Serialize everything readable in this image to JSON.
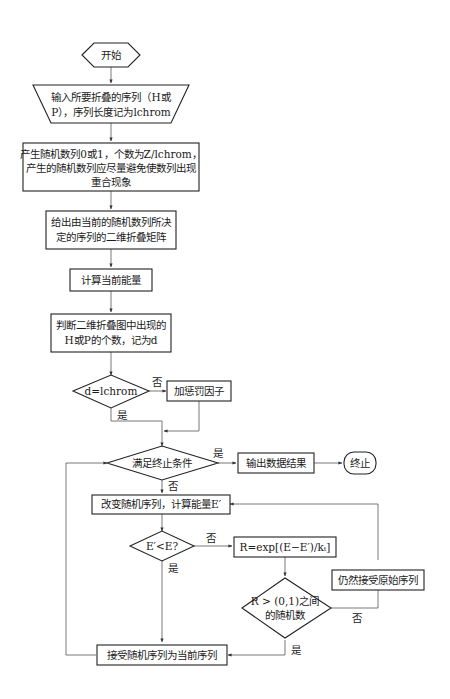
{
  "diagram": {
    "type": "flowchart",
    "nodes": {
      "start": {
        "shape": "hexagon",
        "label": "开始"
      },
      "input": {
        "shape": "trapezoid",
        "lines": [
          "输入所要折叠的序列（H或",
          "P），序列长度记为lchrom"
        ]
      },
      "gen_random": {
        "shape": "rect",
        "lines": [
          "产生随机数列0或1，个数为Z/lchrom，",
          "产生的随机数列应尽量避免使数列出现",
          "重合现象"
        ]
      },
      "matrix": {
        "shape": "rect",
        "lines": [
          "给出由当前的随机数列所决",
          "定的序列的二维折叠矩阵"
        ]
      },
      "calc_energy": {
        "shape": "rect",
        "label": "计算当前能量"
      },
      "count_hp": {
        "shape": "rect",
        "lines": [
          "判断二维折叠图中出现的",
          "H或P的个数，记为d"
        ]
      },
      "check_d": {
        "shape": "diamond",
        "label": "d=lchrom"
      },
      "penalty": {
        "shape": "rect",
        "label": "加惩罚因子"
      },
      "terminate_check": {
        "shape": "diamond",
        "label": "满足终止条件"
      },
      "output": {
        "shape": "rect",
        "label": "输出数据结果"
      },
      "end": {
        "shape": "rounded",
        "label": "终止"
      },
      "change_seq": {
        "shape": "rect",
        "label": "改变随机序列，计算能量E′"
      },
      "compare_e": {
        "shape": "diamond",
        "label": "E′<E?"
      },
      "compute_r": {
        "shape": "rect",
        "label": "R=exp[(E−E′)/kₜ]"
      },
      "r_check": {
        "shape": "diamond",
        "lines": [
          "R > (0,1)之间",
          "的随机数"
        ]
      },
      "keep_original": {
        "shape": "rect",
        "label": "仍然接受原始序列"
      },
      "accept_seq": {
        "shape": "rect",
        "label": "接受随机序列为当前序列"
      }
    },
    "edge_labels": {
      "check_d_no": "否",
      "check_d_yes": "是",
      "terminate_yes": "是",
      "terminate_no": "否",
      "compare_no": "否",
      "compare_yes": "是",
      "r_check_no": "否",
      "r_check_yes": "是"
    }
  }
}
